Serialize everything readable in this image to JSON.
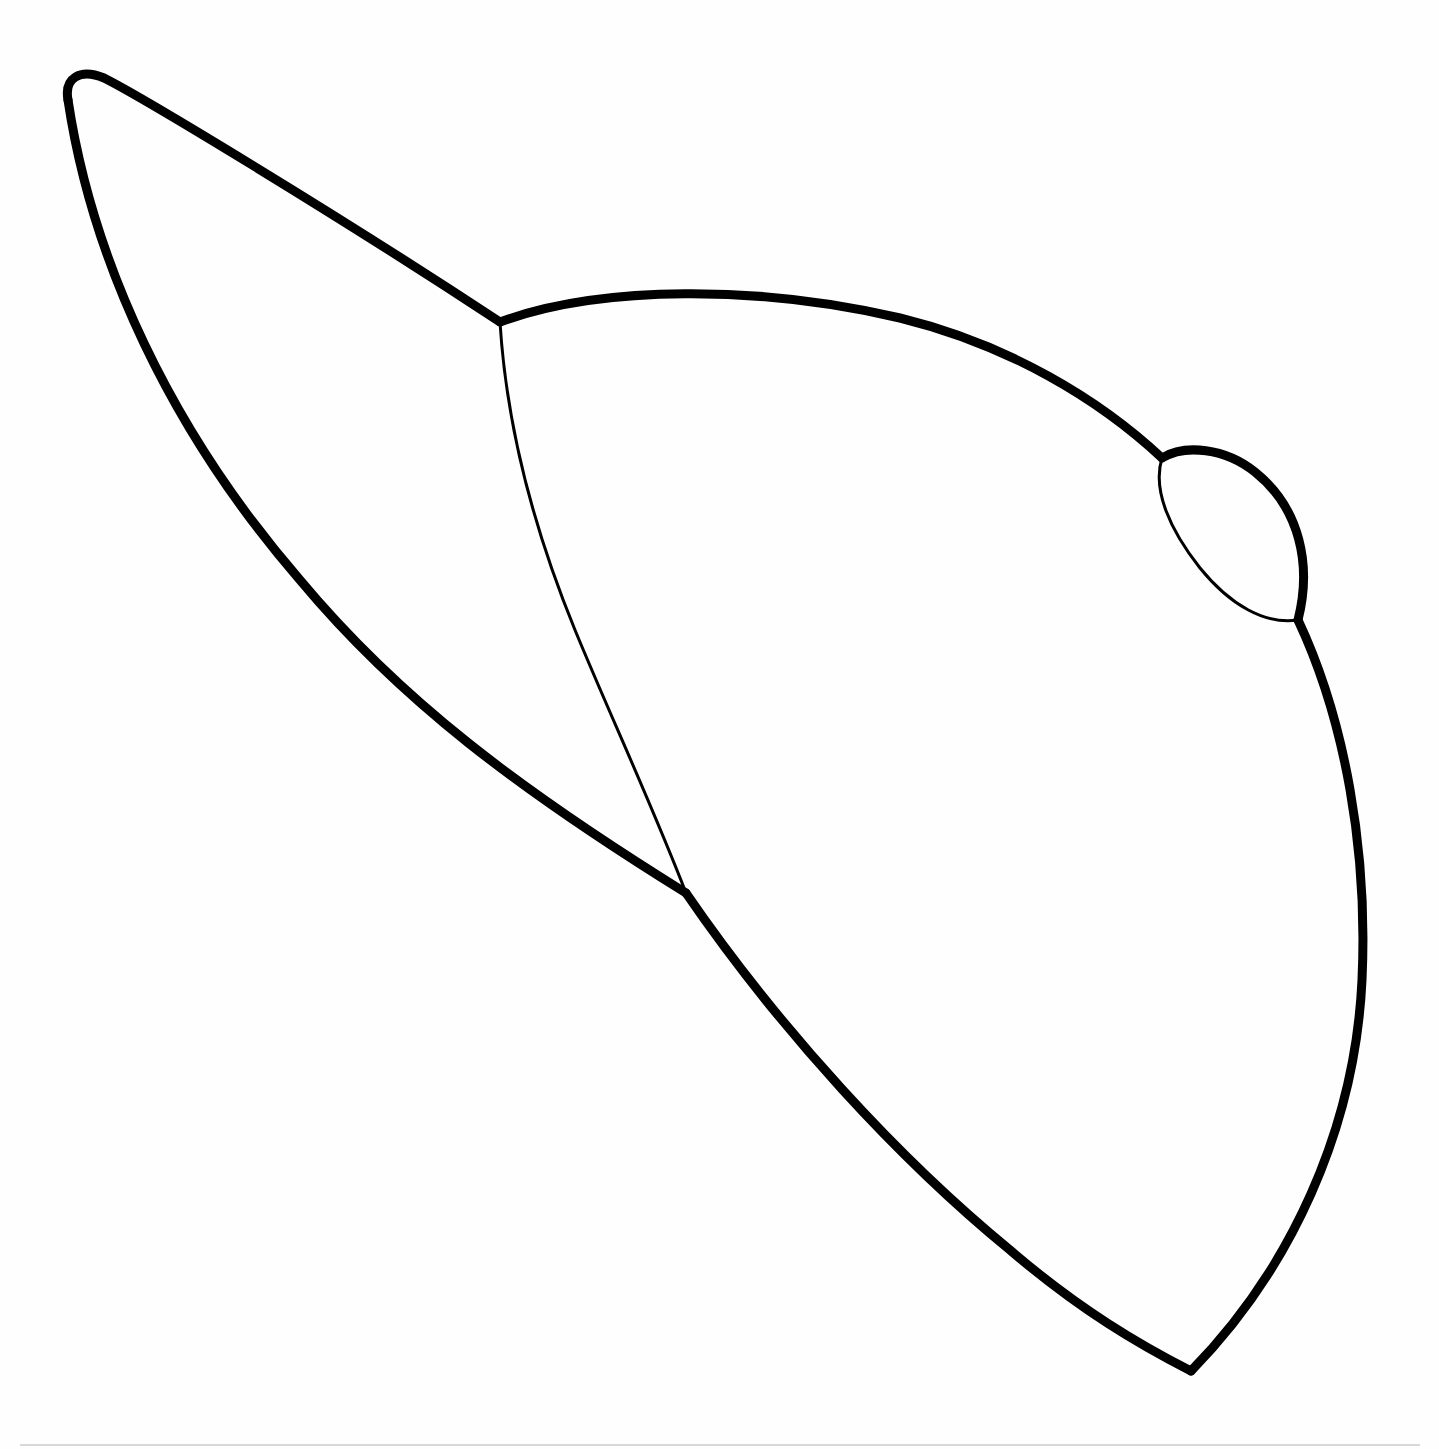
{
  "drawing": {
    "title": "Baseball cap line drawing",
    "subject": "baseball cap",
    "style": "black outline on white",
    "colors": {
      "background": "#fefefe",
      "stroke": "#000000",
      "page_edge": "#d8d8d8"
    },
    "parts": {
      "brim": "brim",
      "crown": "crown",
      "seam": "panel seam",
      "button": "top button"
    }
  }
}
